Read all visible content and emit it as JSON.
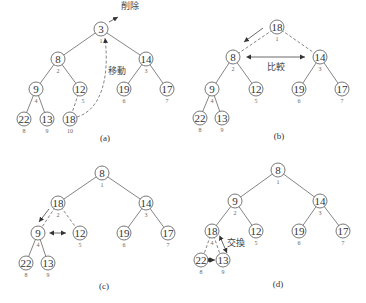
{
  "panels": [
    {
      "id": "a",
      "caption": "(a)",
      "annotations": {
        "delete": "削除",
        "move": "移動"
      },
      "nodes": [
        {
          "v": "3",
          "i": "1"
        },
        {
          "v": "8",
          "i": "2"
        },
        {
          "v": "14",
          "i": "3"
        },
        {
          "v": "9",
          "i": "4"
        },
        {
          "v": "12",
          "i": "5"
        },
        {
          "v": "19",
          "i": "6"
        },
        {
          "v": "17",
          "i": "7"
        },
        {
          "v": "22",
          "i": "8"
        },
        {
          "v": "13",
          "i": "9"
        },
        {
          "v": "18",
          "i": "10"
        }
      ]
    },
    {
      "id": "b",
      "caption": "(b)",
      "annotations": {
        "compare": "比較"
      },
      "nodes": [
        {
          "v": "18",
          "i": "1"
        },
        {
          "v": "8",
          "i": "2"
        },
        {
          "v": "14",
          "i": "3"
        },
        {
          "v": "9",
          "i": "4"
        },
        {
          "v": "12",
          "i": "5"
        },
        {
          "v": "19",
          "i": "6"
        },
        {
          "v": "17",
          "i": "7"
        },
        {
          "v": "22",
          "i": "8"
        },
        {
          "v": "13",
          "i": "9"
        }
      ]
    },
    {
      "id": "c",
      "caption": "(c)",
      "nodes": [
        {
          "v": "8",
          "i": "1"
        },
        {
          "v": "18",
          "i": "2"
        },
        {
          "v": "14",
          "i": "3"
        },
        {
          "v": "9",
          "i": "4"
        },
        {
          "v": "12",
          "i": "5"
        },
        {
          "v": "19",
          "i": "6"
        },
        {
          "v": "17",
          "i": "7"
        },
        {
          "v": "22",
          "i": "8"
        },
        {
          "v": "13",
          "i": "9"
        }
      ]
    },
    {
      "id": "d",
      "caption": "(d)",
      "annotations": {
        "swap": "交換"
      },
      "nodes": [
        {
          "v": "8",
          "i": "1"
        },
        {
          "v": "9",
          "i": "2"
        },
        {
          "v": "14",
          "i": "3"
        },
        {
          "v": "18",
          "i": "4"
        },
        {
          "v": "12",
          "i": "5"
        },
        {
          "v": "19",
          "i": "6"
        },
        {
          "v": "17",
          "i": "7"
        },
        {
          "v": "22",
          "i": "8"
        },
        {
          "v": "13",
          "i": "9"
        }
      ]
    }
  ]
}
